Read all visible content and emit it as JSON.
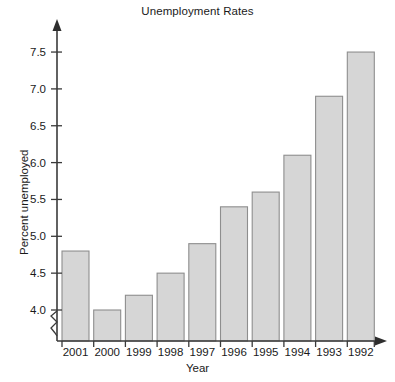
{
  "chart_data": {
    "type": "bar",
    "title": "Unemployment Rates",
    "xlabel": "Year",
    "ylabel": "Percent unemployed",
    "categories": [
      "2001",
      "2000",
      "1999",
      "1998",
      "1997",
      "1996",
      "1995",
      "1994",
      "1993",
      "1992"
    ],
    "values": [
      4.8,
      4.0,
      4.2,
      4.5,
      4.9,
      5.4,
      5.6,
      6.1,
      6.9,
      7.5
    ],
    "ytick_labels": [
      "4.0",
      "4.5",
      "5.0",
      "5.5",
      "6.0",
      "6.5",
      "7.0",
      "7.5"
    ],
    "ytick_values": [
      4.0,
      4.5,
      5.0,
      5.5,
      6.0,
      6.5,
      7.0,
      7.5
    ],
    "ylim": [
      4.0,
      7.75
    ],
    "axis_break": true,
    "grid": false,
    "legend": null,
    "bar_fill_color": "#d6d6d6",
    "bar_border_color": "#8e8e8e",
    "axis_color": "#3a3a3a"
  }
}
